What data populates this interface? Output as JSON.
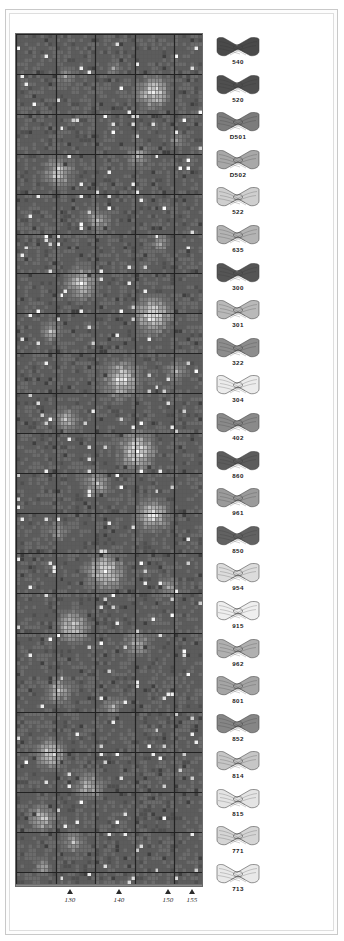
{
  "document": {
    "kind": "cross-stitch-pattern-chart",
    "frame": {
      "show_outer_rule": true,
      "show_inner_rule": true
    }
  },
  "chart": {
    "title": "",
    "cols": 47,
    "rows": 213,
    "cell_px": 4,
    "heavy_line_every": 10,
    "grid_line_color": "#5a5a5a",
    "heavy_line_color": "#222222",
    "border_color": "#6a6a6a"
  },
  "axis": {
    "orientation": "horizontal",
    "label_style": "italic-serif",
    "ticks": [
      {
        "label": "130",
        "x": 55
      },
      {
        "label": "140",
        "x": 104
      },
      {
        "label": "150",
        "x": 153
      },
      {
        "label": "155",
        "x": 177
      }
    ]
  },
  "legend": {
    "title": "",
    "items": [
      {
        "code": "540",
        "color": "#4a4a4a",
        "shade": "very-dark",
        "icon": "thread-skein-icon"
      },
      {
        "code": "520",
        "color": "#4f4f4f",
        "shade": "very-dark",
        "icon": "thread-skein-icon"
      },
      {
        "code": "D501",
        "color": "#7c7c7c",
        "shade": "medium-dark",
        "icon": "thread-skein-icon"
      },
      {
        "code": "D502",
        "color": "#a8a8a8",
        "shade": "medium",
        "icon": "thread-skein-icon"
      },
      {
        "code": "522",
        "color": "#cfcfcf",
        "shade": "light",
        "icon": "thread-skein-icon"
      },
      {
        "code": "635",
        "color": "#b4b4b4",
        "shade": "medium-light",
        "icon": "thread-skein-icon"
      },
      {
        "code": "300",
        "color": "#555555",
        "shade": "very-dark",
        "icon": "thread-skein-icon"
      },
      {
        "code": "301",
        "color": "#b9b9b9",
        "shade": "medium-light",
        "icon": "thread-skein-icon"
      },
      {
        "code": "322",
        "color": "#8d8d8d",
        "shade": "medium",
        "icon": "thread-skein-icon"
      },
      {
        "code": "304",
        "color": "#ececec",
        "shade": "very-light",
        "icon": "thread-skein-icon"
      },
      {
        "code": "402",
        "color": "#8a8a8a",
        "shade": "medium",
        "icon": "thread-skein-icon"
      },
      {
        "code": "860",
        "color": "#5c5c5c",
        "shade": "very-dark",
        "icon": "thread-skein-icon"
      },
      {
        "code": "961",
        "color": "#9b9b9b",
        "shade": "medium",
        "icon": "thread-skein-icon"
      },
      {
        "code": "850",
        "color": "#626262",
        "shade": "dark",
        "icon": "thread-skein-icon"
      },
      {
        "code": "954",
        "color": "#dcdcdc",
        "shade": "very-light",
        "icon": "thread-skein-icon"
      },
      {
        "code": "915",
        "color": "#efefef",
        "shade": "very-light",
        "icon": "thread-skein-icon"
      },
      {
        "code": "962",
        "color": "#b0b0b0",
        "shade": "medium-light",
        "icon": "thread-skein-icon"
      },
      {
        "code": "801",
        "color": "#a5a5a5",
        "shade": "medium",
        "icon": "thread-skein-icon"
      },
      {
        "code": "852",
        "color": "#868686",
        "shade": "medium-dark",
        "icon": "thread-skein-icon"
      },
      {
        "code": "814",
        "color": "#c6c6c6",
        "shade": "light",
        "icon": "thread-skein-icon"
      },
      {
        "code": "815",
        "color": "#e4e4e4",
        "shade": "very-light",
        "icon": "thread-skein-icon"
      },
      {
        "code": "771",
        "color": "#d5d5d5",
        "shade": "light",
        "icon": "thread-skein-icon"
      },
      {
        "code": "713",
        "color": "#e9e9e9",
        "shade": "very-light",
        "icon": "thread-skein-icon"
      }
    ]
  },
  "chart_data": {
    "type": "heatmap",
    "title": "",
    "xlabel": "",
    "ylabel": "",
    "grid": true,
    "legend_position": "right",
    "cols": 47,
    "rows": 213,
    "palette": [
      "#3f3f3f",
      "#4f4f4f",
      "#5c5c5c",
      "#6b6b6b",
      "#7a7a7a",
      "#8a8a8a",
      "#9a9a9a",
      "#ababab",
      "#bcbcbc",
      "#cdcdcd",
      "#dedede",
      "#eeeeee",
      "#fbfbfb"
    ],
    "x": [
      130,
      140,
      150,
      155
    ],
    "note": "Monochrome-rendered floral / fruit motif worked in DCS thread shades; cell values are palette indices."
  }
}
